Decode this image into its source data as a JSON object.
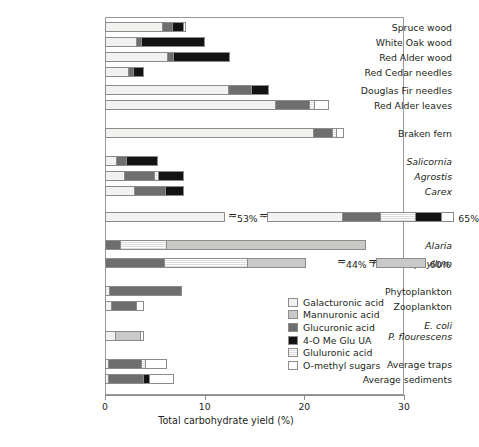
{
  "chart_data": {
    "type": "bar",
    "orientation": "horizontal",
    "stacked": true,
    "title": "",
    "xlabel": "Total carbohydrate yield (%)",
    "ylabel": "",
    "xlim": [
      0,
      30
    ],
    "xticks": [
      0,
      10,
      20,
      30
    ],
    "xtick_labels": [
      "0",
      "10",
      "20",
      "30"
    ],
    "grid": false,
    "legend_position": "inside-lower-right",
    "series": [
      {
        "name": "Galacturonic acid",
        "key": "gal",
        "color": "#f2f2f0"
      },
      {
        "name": "Mannuronic acid",
        "key": "man",
        "color": "#c9c9c7"
      },
      {
        "name": "Glucuronic acid",
        "key": "glc",
        "color": "#6e6e6e"
      },
      {
        "name": "4-O Me Glu UA",
        "key": "4ome",
        "color": "#131313"
      },
      {
        "name": "Gluluronic acid",
        "key": "glu",
        "color": "#eeeeee"
      },
      {
        "name": "O-methyl sugars",
        "key": "ome",
        "color": "#ffffff"
      }
    ],
    "categories": [
      "Spruce wood",
      "White Oak wood",
      "Red Alder wood",
      "Red Cedar needles",
      "Douglas Fir needles",
      "Red Alder leaves",
      "Braken fern",
      "Salicornia",
      "Agrostis",
      "Carex",
      "Eel Grass (Zostera)",
      "Alaria",
      "Thalassiophyllum",
      "Phytoplankton",
      "Zooplankton",
      "E. coli / P. flourescens",
      "Average traps",
      "Average sediments"
    ],
    "rows": [
      {
        "label": "Spruce wood",
        "italic": false,
        "top": 22,
        "segments": [
          {
            "k": "gal",
            "v": 5.75
          },
          {
            "k": "glc",
            "v": 1.0
          },
          {
            "k": "4ome",
            "v": 1.1
          },
          {
            "k": "ome",
            "v": 0.25
          }
        ],
        "total": 8.1
      },
      {
        "label": "White Oak wood",
        "italic": false,
        "top": 37,
        "segments": [
          {
            "k": "gal",
            "v": 3.1
          },
          {
            "k": "glc",
            "v": 0.55
          },
          {
            "k": "4ome",
            "v": 6.35
          }
        ],
        "total": 10.0
      },
      {
        "label": "Red Alder wood",
        "italic": false,
        "top": 52,
        "segments": [
          {
            "k": "gal",
            "v": 6.2
          },
          {
            "k": "glc",
            "v": 0.65
          },
          {
            "k": "4ome",
            "v": 5.65
          }
        ],
        "total": 12.5
      },
      {
        "label": "Red Cedar needles",
        "italic": false,
        "top": 67,
        "segments": [
          {
            "k": "gal",
            "v": 2.3
          },
          {
            "k": "glc",
            "v": 0.55
          },
          {
            "k": "4ome",
            "v": 1.1
          }
        ],
        "total": 3.95
      },
      {
        "label": "Douglas Fir needles",
        "italic": false,
        "top": 85,
        "segments": [
          {
            "k": "gal",
            "v": 12.3
          },
          {
            "k": "glc",
            "v": 2.3
          },
          {
            "k": "4ome",
            "v": 1.9
          }
        ],
        "total": 16.5
      },
      {
        "label": "Red Alder leaves",
        "italic": false,
        "top": 100,
        "segments": [
          {
            "k": "gal",
            "v": 17.1
          },
          {
            "k": "glc",
            "v": 3.4
          },
          {
            "k": "glu",
            "v": 0.45
          },
          {
            "k": "ome",
            "v": 1.55
          }
        ],
        "total": 22.5
      },
      {
        "label": "Braken fern",
        "italic": false,
        "top": 128,
        "segments": [
          {
            "k": "gal",
            "v": 20.9
          },
          {
            "k": "glc",
            "v": 1.9
          },
          {
            "k": "glu",
            "v": 0.35
          },
          {
            "k": "ome",
            "v": 0.85
          }
        ],
        "total": 24.0
      },
      {
        "label": "Salicornia",
        "italic": true,
        "top": 156,
        "segments": [
          {
            "k": "gal",
            "v": 1.15
          },
          {
            "k": "glc",
            "v": 1.0
          },
          {
            "k": "4ome",
            "v": 3.2
          }
        ],
        "total": 5.35
      },
      {
        "label": "Agrostis",
        "italic": true,
        "top": 171,
        "segments": [
          {
            "k": "gal",
            "v": 1.9
          },
          {
            "k": "glc",
            "v": 3.0
          },
          {
            "k": "glu",
            "v": 0.4
          },
          {
            "k": "4ome",
            "v": 2.6
          }
        ],
        "total": 7.9
      },
      {
        "label": "Carex",
        "italic": true,
        "top": 186,
        "segments": [
          {
            "k": "gal",
            "v": 2.9
          },
          {
            "k": "glc",
            "v": 3.1
          },
          {
            "k": "4ome",
            "v": 1.9
          }
        ],
        "total": 7.9
      },
      {
        "label": "Eel Grass (Zostera)",
        "italic": true,
        "top": 212,
        "segments": [
          {
            "k": "gal",
            "v": 12.0
          }
        ],
        "total": 65.0,
        "break": {
          "at_px": 228,
          "label": "53%"
        },
        "resume": [
          {
            "k": "gal",
            "v": 7.5
          },
          {
            "k": "glc",
            "v": 3.8
          },
          {
            "k": "glu",
            "v": 3.6
          },
          {
            "k": "4ome",
            "v": 2.6
          },
          {
            "k": "ome",
            "v": 1.3
          }
        ],
        "end_label": "65%"
      },
      {
        "label": "Alaria",
        "italic": true,
        "top": 240,
        "segments": [
          {
            "k": "glc",
            "v": 1.5
          },
          {
            "k": "glu",
            "v": 4.6
          },
          {
            "k": "man",
            "v": 20.1
          }
        ],
        "total": 26.2
      },
      {
        "label": "Thalassiophyllum",
        "italic": true,
        "top": 258,
        "segments": [
          {
            "k": "glc",
            "v": 5.9
          },
          {
            "k": "glu",
            "v": 8.3
          },
          {
            "k": "man",
            "v": 6.0
          }
        ],
        "total": 60.0,
        "break": {
          "at_px": 337,
          "label": "44%"
        },
        "resume": [
          {
            "k": "man",
            "v": 5.0
          }
        ],
        "end_label": "60%"
      },
      {
        "label": "Phytoplankton",
        "italic": false,
        "top": 286,
        "segments": [
          {
            "k": "gal",
            "v": 0.45
          },
          {
            "k": "glc",
            "v": 7.3
          }
        ],
        "total": 7.75
      },
      {
        "label": "Zooplankton",
        "italic": false,
        "top": 301,
        "segments": [
          {
            "k": "gal",
            "v": 0.6
          },
          {
            "k": "glc",
            "v": 2.5
          },
          {
            "k": "ome",
            "v": 0.85
          }
        ],
        "total": 3.95
      },
      {
        "label": "E. coli",
        "italic": true,
        "top": 320,
        "segments": [],
        "total": 0
      },
      {
        "label": "P. flourescens",
        "italic": true,
        "top": 331,
        "segments": [
          {
            "k": "gal",
            "v": 1.0
          },
          {
            "k": "man",
            "v": 2.5
          },
          {
            "k": "ome",
            "v": 0.45
          }
        ],
        "total": 3.95
      },
      {
        "label": "Average traps",
        "italic": false,
        "top": 359,
        "segments": [
          {
            "k": "gal",
            "v": 0.35
          },
          {
            "k": "glc",
            "v": 3.3
          },
          {
            "k": "glu",
            "v": 0.4
          },
          {
            "k": "ome",
            "v": 2.2
          }
        ],
        "total": 6.25
      },
      {
        "label": "Average sediments",
        "italic": false,
        "top": 374,
        "segments": [
          {
            "k": "gal",
            "v": 0.35
          },
          {
            "k": "glc",
            "v": 3.5
          },
          {
            "k": "4ome",
            "v": 0.55
          },
          {
            "k": "ome",
            "v": 2.5
          }
        ],
        "total": 6.9
      }
    ]
  },
  "axis": {
    "title": "Total carbohydrate yield (%)",
    "ticks": [
      {
        "value": 0,
        "label": "0"
      },
      {
        "value": 10,
        "label": "10"
      },
      {
        "value": 20,
        "label": "20"
      },
      {
        "value": 30,
        "label": "30"
      }
    ]
  },
  "legend": {
    "items": [
      {
        "label": "Galacturonic acid",
        "swatch": "f-gal"
      },
      {
        "label": "Mannuronic acid",
        "swatch": "f-man"
      },
      {
        "label": "Glucuronic acid",
        "swatch": "f-glc"
      },
      {
        "label": "4-O Me Glu UA",
        "swatch": "f-4ome"
      },
      {
        "label": "Gluluronic acid",
        "swatch": "f-glu"
      },
      {
        "label": "O-methyl sugars",
        "swatch": "f-ome"
      }
    ]
  },
  "annotations": [
    {
      "name": "eelgrass-break-label",
      "text": "53%"
    },
    {
      "name": "eelgrass-total-label",
      "text": "65%"
    },
    {
      "name": "thalassiophyllum-break-label",
      "text": "44%"
    },
    {
      "name": "thalassiophyllum-total-label",
      "text": "60%"
    }
  ]
}
